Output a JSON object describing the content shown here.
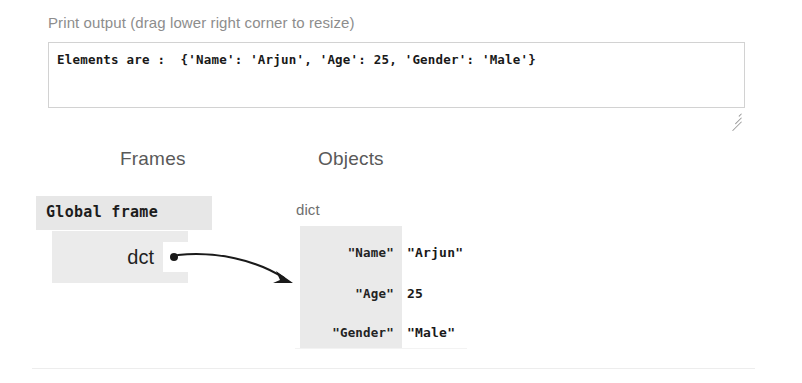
{
  "print_output": {
    "label": "Print output (drag lower right corner to resize)",
    "text": "Elements are :  {'Name': 'Arjun', 'Age': 25, 'Gender': 'Male'}",
    "resize_handle_name": "resize-grip-icon"
  },
  "visualization": {
    "headings": {
      "frames": "Frames",
      "objects": "Objects"
    },
    "frame": {
      "title": "Global frame",
      "variables": [
        {
          "name": "dct",
          "pointer": "●"
        }
      ]
    },
    "object": {
      "type_label": "dict",
      "entries": [
        {
          "key": "\"Name\"",
          "value": "\"Arjun\""
        },
        {
          "key": "\"Age\"",
          "value": "25"
        },
        {
          "key": "\"Gender\"",
          "value": "\"Male\""
        }
      ]
    }
  },
  "colors": {
    "frame_header_bg": "#e7e7e7",
    "frame_body_bg": "#ebebeb",
    "object_bg": "#eaeaea",
    "label_text": "#8d8d8d",
    "heading_text": "#595959",
    "box_border": "#d2d2d2",
    "arrow": "#1a1a1a"
  }
}
